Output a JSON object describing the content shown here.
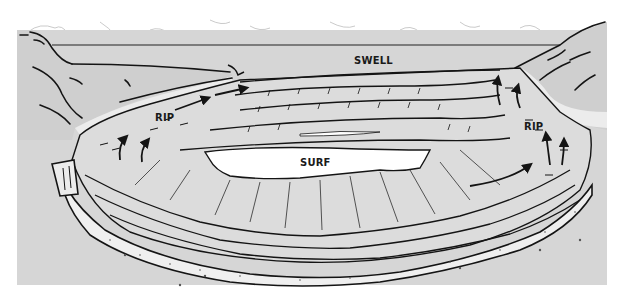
{
  "diagram": {
    "colors": {
      "background": "#ffffff",
      "sea": "#d6d6d6",
      "land": "#d2d2d2",
      "sand": "#ececec",
      "foam": "#ffffff",
      "ink": "#141414"
    },
    "labels": {
      "swell": "SWELL",
      "surf": "SURF",
      "rip_left": "RIP",
      "rip_right": "RIP"
    },
    "arrows": {
      "rip_left_count": 4,
      "rip_right_count": 4,
      "meaning": "rip current flow direction"
    }
  }
}
